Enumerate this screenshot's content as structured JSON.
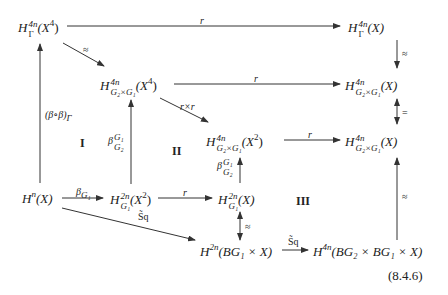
{
  "nodes": {
    "top_left": {
      "base": "H",
      "sup": "4n",
      "sub": "Γ",
      "arg": "(X",
      "arg_sup": "4",
      "arg_close": ")"
    },
    "top_right": {
      "base": "H",
      "sup": "4n",
      "sub": "Γ",
      "arg": "(X)"
    },
    "mid1_left": {
      "base": "H",
      "sup": "4n",
      "sub": "G₂×G₁",
      "arg": "(X",
      "arg_sup": "4",
      "arg_close": ")"
    },
    "mid1_right": {
      "base": "H",
      "sup": "4n",
      "sub": "G₂×G₁",
      "arg": "(X)"
    },
    "mid2_center": {
      "base": "H",
      "sup": "4n",
      "sub": "G₂×G₁",
      "arg": "(X",
      "arg_sup": "2",
      "arg_close": ")"
    },
    "mid2_right": {
      "base": "H",
      "sup": "4n",
      "sub": "G₂×G₁",
      "arg": "(X)"
    },
    "bottom_left": {
      "base": "H",
      "sup": "n",
      "arg": "(X)"
    },
    "bottom_mid": {
      "base": "H",
      "sup": "2n",
      "sub": "G₁",
      "arg": "(X",
      "arg_sup": "2",
      "arg_close": ")"
    },
    "bottom_center": {
      "base": "H",
      "sup": "2n",
      "sub": "G₁",
      "arg": "(X)"
    },
    "lowest_left": {
      "base": "H",
      "sup": "2n",
      "arg": "(BG₁ × X)"
    },
    "lowest_right": {
      "base": "H",
      "sup": "4n",
      "arg": "(BG₂ × BG₁ × X)"
    }
  },
  "labels": {
    "top_r": "r",
    "approx1": "≈",
    "mid1_r": "r",
    "rxr": "r×r",
    "mid2_r": "r",
    "bottom_beta": "β",
    "bottom_beta_sub": "G₁",
    "bottom_r": "r",
    "beta_comp": "(β∘β)",
    "beta_comp_sub": "Γ",
    "beta_up1": "β",
    "beta_up1_sup": "G₁",
    "beta_up1_sub": "G₂",
    "beta_up2": "β",
    "beta_up2_sup": "G₁",
    "beta_up2_sub": "G₂",
    "right_approx_top": "≈",
    "right_eq": "=",
    "right_approx_bottom": "≈",
    "center_approx": "≈",
    "sq_diag": "S̃q",
    "sq_bottom": "S̃q"
  },
  "regions": {
    "I": "I",
    "II": "II",
    "III": "III"
  },
  "equation_number": "(8.4.6)"
}
